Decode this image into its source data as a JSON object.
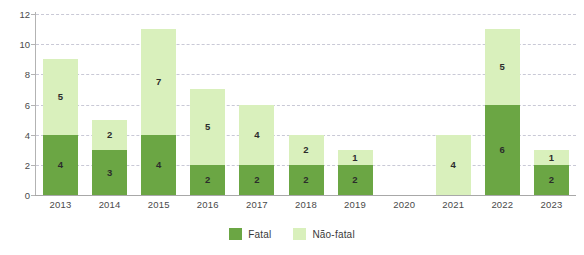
{
  "chart_data": {
    "type": "bar",
    "subtype": "stacked",
    "title": "",
    "xlabel": "",
    "ylabel": "",
    "categories": [
      "2013",
      "2014",
      "2015",
      "2016",
      "2017",
      "2018",
      "2019",
      "2020",
      "2021",
      "2022",
      "2023"
    ],
    "series": [
      {
        "name": "Fatal",
        "color": "#6ba644",
        "values": [
          4,
          3,
          4,
          2,
          2,
          2,
          2,
          0,
          0,
          6,
          2
        ]
      },
      {
        "name": "Não-fatal",
        "color": "#d9f0bc",
        "values": [
          5,
          2,
          7,
          5,
          4,
          2,
          1,
          0,
          4,
          5,
          1
        ]
      }
    ],
    "totals": [
      9,
      5,
      11,
      7,
      6,
      4,
      3,
      0,
      4,
      11,
      3
    ],
    "ylim": [
      0,
      12
    ],
    "yticks": [
      0,
      2,
      4,
      6,
      8,
      10,
      12
    ],
    "ytick_labels": [
      "0",
      "2",
      "4",
      "6",
      "8",
      "10",
      "12"
    ],
    "grid": true,
    "grid_style": "dashed",
    "grid_color": "#c9c9d6",
    "legend_position": "bottom-center",
    "data_labels": true
  },
  "legend": {
    "items": [
      {
        "label": "Fatal",
        "color": "#6ba644"
      },
      {
        "label": "Não-fatal",
        "color": "#d9f0bc"
      }
    ]
  }
}
